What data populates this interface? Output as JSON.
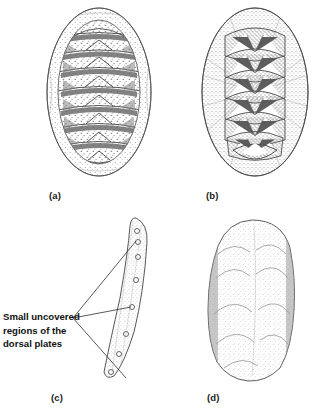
{
  "figure": {
    "background_color": "#ffffff",
    "ink_color": "#4a4a4a",
    "dark_ink_color": "#2b2b2b",
    "text_color": "#111111",
    "width": 324,
    "height": 416
  },
  "panels": [
    {
      "id": "a",
      "label": "(a)",
      "view": "dorsal view of chiton with eight transverse speckled plates",
      "plate_count": 8,
      "outline_shape": "ellipse"
    },
    {
      "id": "b",
      "label": "(b)",
      "view": "dorsal view with overlapping plates bearing dark radiating triangular markings",
      "plate_count": 7,
      "outline_shape": "ellipse"
    },
    {
      "id": "c",
      "label": "(c)",
      "view": "narrow curved lateral profile with small uncovered plate regions",
      "uncovered_region_count": 8,
      "outline_shape": "curved-sliver"
    },
    {
      "id": "d",
      "label": "(d)",
      "view": "stippled rounded form with faint chevron lines",
      "chevron_count": 5,
      "outline_shape": "rounded-oblong"
    }
  ],
  "annotation": {
    "lines": [
      "Small uncovered",
      "regions of the",
      "dorsal plates"
    ],
    "leader_line_count": 3
  }
}
